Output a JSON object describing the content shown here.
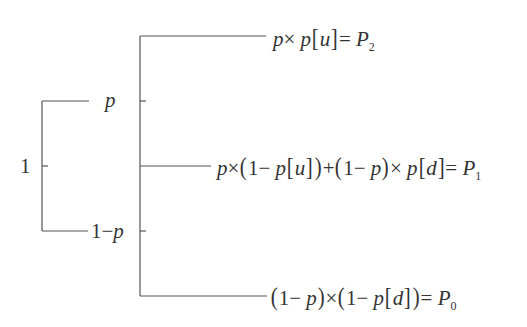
{
  "diagram": {
    "type": "probability-tree",
    "root": {
      "label": "1"
    },
    "first_level": [
      {
        "label": "p",
        "branch": "up"
      },
      {
        "label": "1 − p",
        "branch": "down"
      }
    ],
    "outcomes": [
      {
        "id": "P2",
        "expression": "p × p[u] = P₂"
      },
      {
        "id": "P1",
        "expression": "p × (1 − p[u]) + (1 − p) × p[d] = P₁"
      },
      {
        "id": "P0",
        "expression": "(1 − p) × (1 − p[d]) = P₀"
      }
    ],
    "symbols": {
      "one": "1",
      "p": "p",
      "minus": "−",
      "times": "×",
      "plus": "+",
      "equals": "=",
      "u": "u",
      "d": "d",
      "P": "P",
      "sub2": "2",
      "sub1": "1",
      "sub0": "0",
      "lparen": "(",
      "rparen": ")",
      "lbracket": "[",
      "rbracket": "]"
    }
  }
}
